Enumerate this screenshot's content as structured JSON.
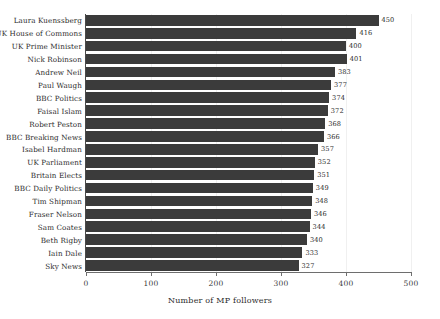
{
  "chart_data": {
    "type": "bar",
    "orientation": "horizontal",
    "title": "",
    "xlabel": "Number of MP followers",
    "ylabel": "",
    "xlim": [
      0,
      500
    ],
    "xticks": [
      0,
      100,
      200,
      300,
      400,
      500
    ],
    "xtick_labels": [
      "0",
      "100",
      "200",
      "300",
      "400",
      "500"
    ],
    "grid": true,
    "legend": false,
    "bar_color": "#3b3b3b",
    "categories": [
      "Laura Kuenssberg",
      "UK House of Commons",
      "UK Prime Minister",
      "Nick Robinson",
      "Andrew Neil",
      "Paul Waugh",
      "BBC Politics",
      "Faisal Islam",
      "Robert Peston",
      "BBC Breaking News",
      "Isabel Hardman",
      "UK Parliament",
      "Britain Elects",
      "BBC Daily Politics",
      "Tim Shipman",
      "Fraser Nelson",
      "Sam Coates",
      "Beth Rigby",
      "Iain Dale",
      "Sky News"
    ],
    "values": [
      450,
      416,
      400,
      401,
      383,
      377,
      374,
      372,
      368,
      366,
      357,
      352,
      351,
      349,
      348,
      346,
      344,
      340,
      333,
      327
    ],
    "value_labels": [
      "450",
      "416",
      "400",
      "401",
      "383",
      "377",
      "374",
      "372",
      "368",
      "366",
      "357",
      "352",
      "351",
      "349",
      "348",
      "346",
      "344",
      "340",
      "333",
      "327"
    ]
  }
}
